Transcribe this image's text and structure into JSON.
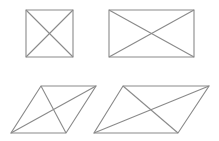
{
  "figure": {
    "width": 219,
    "height": 141,
    "background": "#ffffff",
    "stroke_color": "#8a8a8a",
    "stroke_width": 1.1,
    "shapes": [
      {
        "name": "square",
        "vertices": [
          [
            26,
            10
          ],
          [
            73,
            10
          ],
          [
            73,
            57
          ],
          [
            26,
            57
          ]
        ]
      },
      {
        "name": "rectangle",
        "vertices": [
          [
            109,
            10
          ],
          [
            194,
            10
          ],
          [
            194,
            57
          ],
          [
            109,
            57
          ]
        ]
      },
      {
        "name": "rhombus",
        "vertices": [
          [
            41,
            86
          ],
          [
            96,
            86
          ],
          [
            66,
            133
          ],
          [
            11,
            133
          ]
        ]
      },
      {
        "name": "parallelogram",
        "vertices": [
          [
            123,
            86
          ],
          [
            209,
            86
          ],
          [
            178,
            133
          ],
          [
            94,
            133
          ]
        ]
      }
    ]
  }
}
